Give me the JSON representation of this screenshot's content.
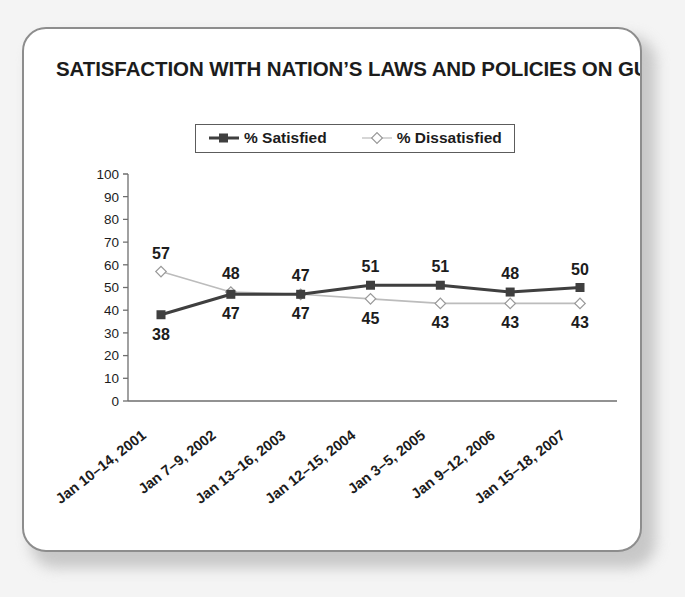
{
  "chart_data": {
    "type": "line",
    "title": "SATISFACTION WITH NATION’S LAWS AND POLICIES ON GUNS",
    "xlabel": "",
    "ylabel": "",
    "ylim": [
      0,
      100
    ],
    "yticks": [
      0,
      10,
      20,
      30,
      40,
      50,
      60,
      70,
      80,
      90,
      100
    ],
    "ytick_labels": [
      "0",
      "10",
      "20",
      "30",
      "40",
      "50",
      "60",
      "70",
      "80",
      "90",
      "100"
    ],
    "grid": false,
    "legend_position": "top-center",
    "categories": [
      "Jan 10–14, 2001",
      "Jan 7–9, 2002",
      "Jan 13–16, 2003",
      "Jan 12–15, 2004",
      "Jan 3–5, 2005",
      "Jan 9–12, 2006",
      "Jan 15–18, 2007"
    ],
    "series": [
      {
        "name": "% Satisfied",
        "values": [
          38,
          47,
          47,
          51,
          51,
          48,
          50
        ],
        "labels": [
          "38",
          "47",
          "47",
          "51",
          "51",
          "48",
          "50"
        ],
        "label_side": [
          "below",
          "below",
          "below",
          "above",
          "above",
          "above",
          "above"
        ],
        "color": "#3f3f3f",
        "marker": "square",
        "line_width": 3
      },
      {
        "name": "% Dissatisfied",
        "values": [
          57,
          48,
          47,
          45,
          43,
          43,
          43
        ],
        "labels": [
          "57",
          "48",
          "47",
          "45",
          "43",
          "43",
          "43"
        ],
        "label_side": [
          "above",
          "above",
          "above",
          "below",
          "below",
          "below",
          "below"
        ],
        "color": "#bcbcbc",
        "marker": "diamond",
        "line_width": 1.6
      }
    ]
  },
  "legend": {
    "items": [
      {
        "label": "% Satisfied",
        "marker": "square-marker-icon"
      },
      {
        "label": "% Dissatisfied",
        "marker": "diamond-marker-icon"
      }
    ]
  },
  "colors": {
    "satisfied": "#3f3f3f",
    "dissatisfied": "#bcbcbc",
    "axis": "#6e6e6e",
    "card_border": "#8d8d8d",
    "page_background": "#f4f4f4",
    "text": "#1c1c1c"
  }
}
